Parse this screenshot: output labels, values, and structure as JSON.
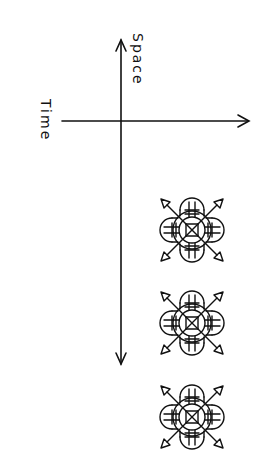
{
  "diagram": {
    "labels": {
      "space": "Space",
      "time": "Time"
    },
    "axes": {
      "time_axis": {
        "orientation": "horizontal",
        "direction": "right",
        "arrowheads": 1
      },
      "space_axis": {
        "orientation": "vertical",
        "direction": "both",
        "arrowheads": 2
      }
    },
    "glyphs": [
      {
        "name": "mandala-glyph-1",
        "cx": 192,
        "cy": 230
      },
      {
        "name": "mandala-glyph-2",
        "cx": 192,
        "cy": 323
      },
      {
        "name": "mandala-glyph-3",
        "cx": 192,
        "cy": 417
      }
    ],
    "stroke_color": "#111111",
    "background_color": "#ffffff"
  }
}
